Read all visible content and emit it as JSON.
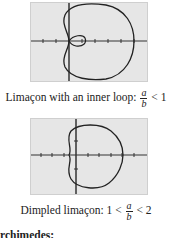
{
  "figures": [
    {
      "caption_prefix": "Limaçon with an inner loop: ",
      "frac_num": "a",
      "frac_den": "b",
      "caption_suffix": " < 1",
      "curve": "limacon-inner-loop"
    },
    {
      "caption_prefix": "Dimpled limaçon: 1 < ",
      "frac_num": "a",
      "frac_den": "b",
      "caption_suffix": " < 2",
      "curve": "dimpled-limacon"
    }
  ],
  "bottom_text": "rchimedes:"
}
